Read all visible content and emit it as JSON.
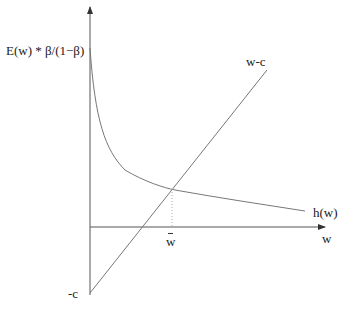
{
  "diagram": {
    "y_axis_label": "E(w) * β/(1−β)",
    "x_axis_label": "w",
    "curve_h_label": "h(w)",
    "line_label": "w-c",
    "intercept_label": "-c",
    "reservation_wage_label": "w",
    "colors": {
      "axes": "#555555",
      "curve": "#777777",
      "line": "#777777",
      "dotted": "#aaaaaa",
      "text": "#222222"
    }
  }
}
